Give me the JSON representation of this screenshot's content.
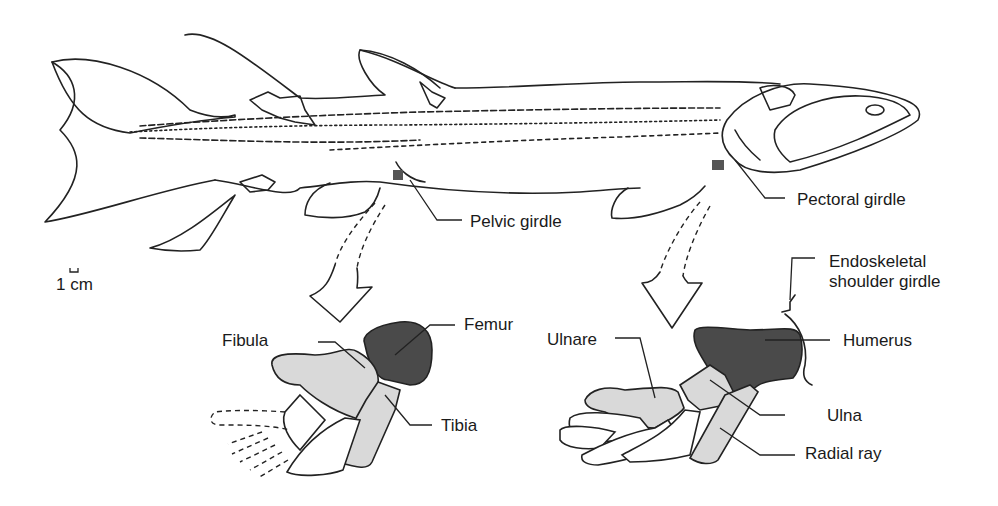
{
  "figure": {
    "scale_bar": {
      "label": "1 cm"
    },
    "body_labels": {
      "pelvic_girdle": "Pelvic girdle",
      "pectoral_girdle": "Pectoral girdle"
    },
    "pelvic_fin_detail": {
      "femur": "Femur",
      "fibula": "Fibula",
      "tibia": "Tibia"
    },
    "pectoral_fin_detail": {
      "endoskeletal_shoulder_girdle_line1": "Endoskeletal",
      "endoskeletal_shoulder_girdle_line2": "shoulder girdle",
      "humerus": "Humerus",
      "ulnare": "Ulnare",
      "ulna": "Ulna",
      "radial_ray": "Radial ray"
    },
    "colors": {
      "outline": "#222222",
      "proximal_bone": "#4a4a4a",
      "distal_bone": "#d9d9d9",
      "background": "#ffffff"
    }
  }
}
